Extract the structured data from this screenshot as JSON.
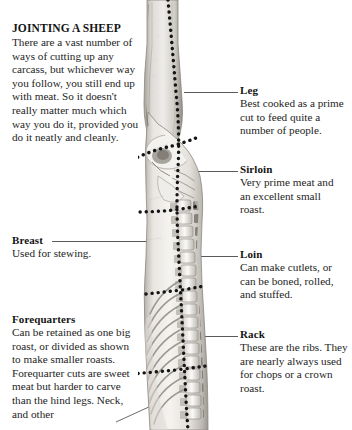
{
  "document": {
    "title": "JOINTING A SHEEP",
    "intro": "There are a vast number of ways of cutting up any carcass, but whichever way you follow, you still end up with meat. So it doesn't really matter much which way you do it, provided you do it neatly and cleanly."
  },
  "labels": {
    "leg": {
      "heading": "Leg",
      "body": "Best cooked as a prime cut to feed quite a number of people."
    },
    "sirloin": {
      "heading": "Sirloin",
      "body": "Very prime meat and an excellent small roast."
    },
    "loin": {
      "heading": "Loin",
      "body": "Can make cutlets, or can be boned, rolled, and stuffed."
    },
    "rack": {
      "heading": "Rack",
      "body": "These are the ribs. They are nearly always used for chops or a crown roast."
    },
    "breast": {
      "heading": "Breast",
      "body": "Used for stewing."
    },
    "forequarters": {
      "heading": "Forequarters",
      "body": "Can be retained as one big roast, or divided as shown to make smaller roasts. Forequarter cuts are sweet meat but harder to carve than the hind legs. Neck, and other"
    }
  },
  "illustration": {
    "name": "sheep-carcass-diagram",
    "description": "Side view engraving of a sheep carcass skeleton with dotted cutting lines",
    "colors": {
      "leader_line": "#5a5a5a",
      "cut_line": "#1a1a1a",
      "body_light": "#f2f0ed",
      "body_mid": "#c9c6c1",
      "body_dark": "#8d8a85",
      "text": "#242424",
      "heading": "#141414",
      "background": "#ffffff"
    }
  }
}
